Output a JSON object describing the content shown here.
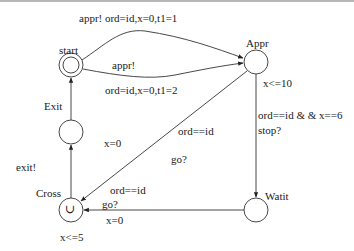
{
  "diagram": {
    "type": "timed-automaton",
    "nodes": [
      {
        "id": "start",
        "label": "start",
        "initial": true,
        "cx": 71,
        "cy": 65
      },
      {
        "id": "appr",
        "label": "Appr",
        "invariant": "x<=10",
        "cx": 256,
        "cy": 62
      },
      {
        "id": "watit",
        "label": "Watit",
        "cx": 256,
        "cy": 210
      },
      {
        "id": "cross",
        "label": "Cross",
        "invariant": "x<=5",
        "urgent_symbol": "∪",
        "cx": 71,
        "cy": 210
      },
      {
        "id": "exit",
        "label": "Exit",
        "cx": 71,
        "cy": 132
      }
    ],
    "edges": [
      {
        "from": "start",
        "to": "appr",
        "sync": "appr!",
        "update": "ord=id,x=0,t1=1",
        "label": "appr!  ord=id,x=0,t1=1"
      },
      {
        "from": "start",
        "to": "appr",
        "sync": "appr!",
        "update": "ord=id,x=0,t1=2"
      },
      {
        "from": "appr",
        "to": "watit",
        "guard": "ord==id & & x==6",
        "sync": "stop?"
      },
      {
        "from": "appr",
        "to": "cross",
        "guard": "ord==id",
        "sync": "go?",
        "update": "x=0"
      },
      {
        "from": "watit",
        "to": "cross",
        "guard": "ord==id",
        "sync": "go?",
        "update": "x=0"
      },
      {
        "from": "cross",
        "to": "exit",
        "sync": "exit!"
      },
      {
        "from": "exit",
        "to": "start"
      }
    ]
  },
  "labels": {
    "start": "start",
    "appr": "Appr",
    "watit": "Watit",
    "cross": "Cross",
    "exit": "Exit",
    "appr_inv": "x<=10",
    "cross_inv": "x<=5",
    "cross_symbol": "∪",
    "e1": "appr!  ord=id,x=0,t1=1",
    "e2_sync": "appr!",
    "e2_update": "ord=id,x=0,t1=2",
    "e3_guard": "ord==id & & x==6",
    "e3_sync": "stop?",
    "e4_guard": "ord==id",
    "e4_sync": "go?",
    "e4_update": "x=0",
    "e5_guard": "ord==id",
    "e5_sync": "go?",
    "e5_update": "x=0",
    "e6_sync": "exit!"
  }
}
